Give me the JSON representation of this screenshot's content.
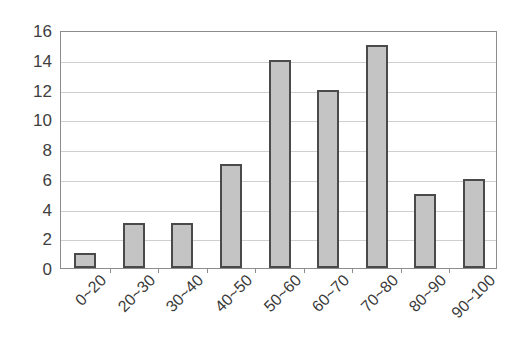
{
  "chart_data": {
    "type": "bar",
    "title": "",
    "subtitle": "",
    "xlabel": "",
    "ylabel": "",
    "categories": [
      "0~20",
      "20~30",
      "30~40",
      "40~50",
      "50~60",
      "60~70",
      "70~80",
      "80~90",
      "90~100"
    ],
    "values": [
      1,
      3,
      3,
      7,
      14,
      12,
      15,
      5,
      6
    ],
    "ylim": [
      0,
      16
    ],
    "ytick_labels": [
      "0",
      "2",
      "4",
      "6",
      "8",
      "10",
      "12",
      "14",
      "16"
    ],
    "ytick_values": [
      0,
      2,
      4,
      6,
      8,
      10,
      12,
      14,
      16
    ],
    "grid": true,
    "grid_axis": "y",
    "legend": false,
    "legend_position": "none",
    "bar_fill_color": "#c4c4c4",
    "bar_border_color": "#4a4a4a",
    "gridline_color": "#cfcfcf",
    "axis_color": "#8c8c8c",
    "background_color": "#ffffff",
    "xtick_label_rotation": -45
  }
}
